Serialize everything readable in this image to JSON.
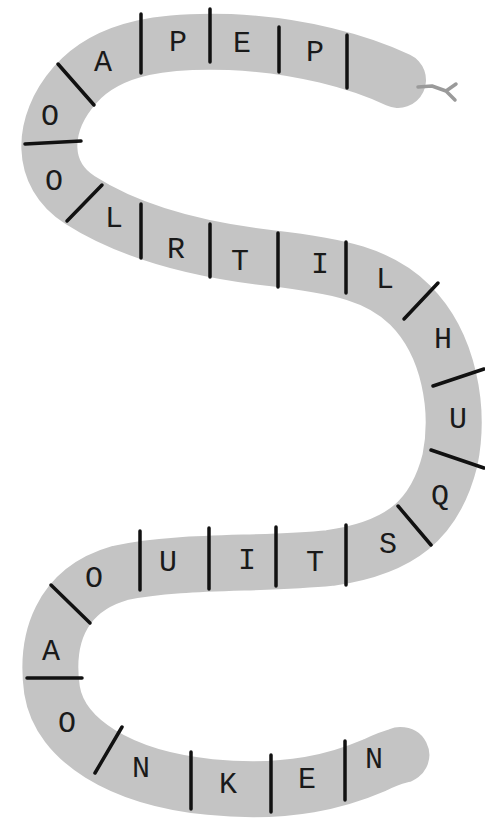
{
  "puzzle": {
    "type": "snake-letter-chain",
    "body_color": "#c4c4c4",
    "tongue_color": "#9a9a9a",
    "divider_color": "#111111",
    "letters": [
      {
        "char": "P",
        "x": 315,
        "y": 53
      },
      {
        "char": "E",
        "x": 242,
        "y": 44
      },
      {
        "char": "P",
        "x": 178,
        "y": 43
      },
      {
        "char": "A",
        "x": 103,
        "y": 63
      },
      {
        "char": "O",
        "x": 50,
        "y": 117
      },
      {
        "char": "O",
        "x": 54,
        "y": 182
      },
      {
        "char": "L",
        "x": 114,
        "y": 219
      },
      {
        "char": "R",
        "x": 176,
        "y": 250
      },
      {
        "char": "T",
        "x": 240,
        "y": 262
      },
      {
        "char": "I",
        "x": 320,
        "y": 265
      },
      {
        "char": "L",
        "x": 385,
        "y": 280
      },
      {
        "char": "H",
        "x": 443,
        "y": 340
      },
      {
        "char": "U",
        "x": 458,
        "y": 420
      },
      {
        "char": "Q",
        "x": 440,
        "y": 497
      },
      {
        "char": "S",
        "x": 388,
        "y": 545
      },
      {
        "char": "T",
        "x": 315,
        "y": 563
      },
      {
        "char": "I",
        "x": 247,
        "y": 561
      },
      {
        "char": "U",
        "x": 168,
        "y": 563
      },
      {
        "char": "O",
        "x": 94,
        "y": 579
      },
      {
        "char": "A",
        "x": 51,
        "y": 652
      },
      {
        "char": "O",
        "x": 67,
        "y": 724
      },
      {
        "char": "N",
        "x": 141,
        "y": 769
      },
      {
        "char": "K",
        "x": 228,
        "y": 785
      },
      {
        "char": "E",
        "x": 307,
        "y": 780
      },
      {
        "char": "N",
        "x": 374,
        "y": 760
      }
    ],
    "dividers": [
      {
        "x1": 347,
        "y1": 35,
        "x2": 347,
        "y2": 88
      },
      {
        "x1": 279,
        "y1": 27,
        "x2": 279,
        "y2": 72
      },
      {
        "x1": 210,
        "y1": 9,
        "x2": 210,
        "y2": 62
      },
      {
        "x1": 141,
        "y1": 14,
        "x2": 141,
        "y2": 73
      },
      {
        "x1": 58,
        "y1": 64,
        "x2": 94,
        "y2": 105
      },
      {
        "x1": 25,
        "y1": 144,
        "x2": 81,
        "y2": 141
      },
      {
        "x1": 67,
        "y1": 221,
        "x2": 102,
        "y2": 185
      },
      {
        "x1": 141,
        "y1": 204,
        "x2": 141,
        "y2": 258
      },
      {
        "x1": 210,
        "y1": 224,
        "x2": 210,
        "y2": 277
      },
      {
        "x1": 278,
        "y1": 233,
        "x2": 278,
        "y2": 287
      },
      {
        "x1": 346,
        "y1": 242,
        "x2": 346,
        "y2": 293
      },
      {
        "x1": 404,
        "y1": 319,
        "x2": 438,
        "y2": 283
      },
      {
        "x1": 433,
        "y1": 386,
        "x2": 484,
        "y2": 369
      },
      {
        "x1": 431,
        "y1": 450,
        "x2": 484,
        "y2": 468
      },
      {
        "x1": 398,
        "y1": 506,
        "x2": 431,
        "y2": 545
      },
      {
        "x1": 346,
        "y1": 525,
        "x2": 346,
        "y2": 585
      },
      {
        "x1": 276,
        "y1": 527,
        "x2": 276,
        "y2": 586
      },
      {
        "x1": 209,
        "y1": 528,
        "x2": 209,
        "y2": 589
      },
      {
        "x1": 140,
        "y1": 531,
        "x2": 140,
        "y2": 590
      },
      {
        "x1": 51,
        "y1": 585,
        "x2": 90,
        "y2": 623
      },
      {
        "x1": 27,
        "y1": 678,
        "x2": 82,
        "y2": 678
      },
      {
        "x1": 95,
        "y1": 773,
        "x2": 122,
        "y2": 727
      },
      {
        "x1": 191,
        "y1": 752,
        "x2": 191,
        "y2": 809
      },
      {
        "x1": 271,
        "y1": 755,
        "x2": 271,
        "y2": 812
      },
      {
        "x1": 345,
        "y1": 741,
        "x2": 345,
        "y2": 800
      }
    ]
  }
}
